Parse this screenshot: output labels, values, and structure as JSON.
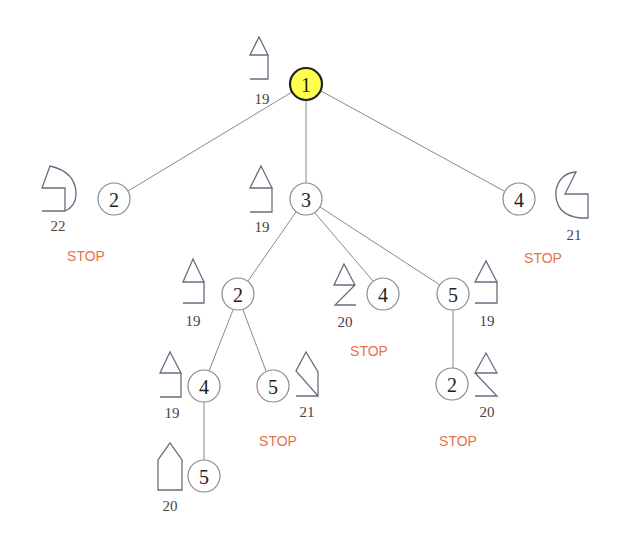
{
  "diagram": {
    "type": "search-tree",
    "colors": {
      "root_fill": "#ffff4d",
      "edge": "#8a8a8a",
      "stop": "#e8714a",
      "shape": "#6b6b80"
    },
    "nodes": [
      {
        "id": "n1",
        "label": "1",
        "root": true,
        "score": "19",
        "stop": ""
      },
      {
        "id": "n2a",
        "label": "2",
        "score": "22",
        "stop": "STOP"
      },
      {
        "id": "n3",
        "label": "3",
        "score": "19",
        "stop": ""
      },
      {
        "id": "n4a",
        "label": "4",
        "score": "21",
        "stop": "STOP"
      },
      {
        "id": "n2b",
        "label": "2",
        "score": "19",
        "stop": ""
      },
      {
        "id": "n4b",
        "label": "4",
        "score": "20",
        "stop": "STOP"
      },
      {
        "id": "n5a",
        "label": "5",
        "score": "19",
        "stop": ""
      },
      {
        "id": "n4c",
        "label": "4",
        "score": "19",
        "stop": ""
      },
      {
        "id": "n5b",
        "label": "5",
        "score": "21",
        "stop": "STOP"
      },
      {
        "id": "n2c",
        "label": "2",
        "score": "20",
        "stop": "STOP"
      },
      {
        "id": "n5c",
        "label": "5",
        "score": "20",
        "stop": ""
      }
    ],
    "edges": [
      [
        "n1",
        "n2a"
      ],
      [
        "n1",
        "n3"
      ],
      [
        "n1",
        "n4a"
      ],
      [
        "n3",
        "n2b"
      ],
      [
        "n3",
        "n4b"
      ],
      [
        "n3",
        "n5a"
      ],
      [
        "n2b",
        "n4c"
      ],
      [
        "n2b",
        "n5b"
      ],
      [
        "n5a",
        "n2c"
      ],
      [
        "n4c",
        "n5c"
      ]
    ]
  }
}
